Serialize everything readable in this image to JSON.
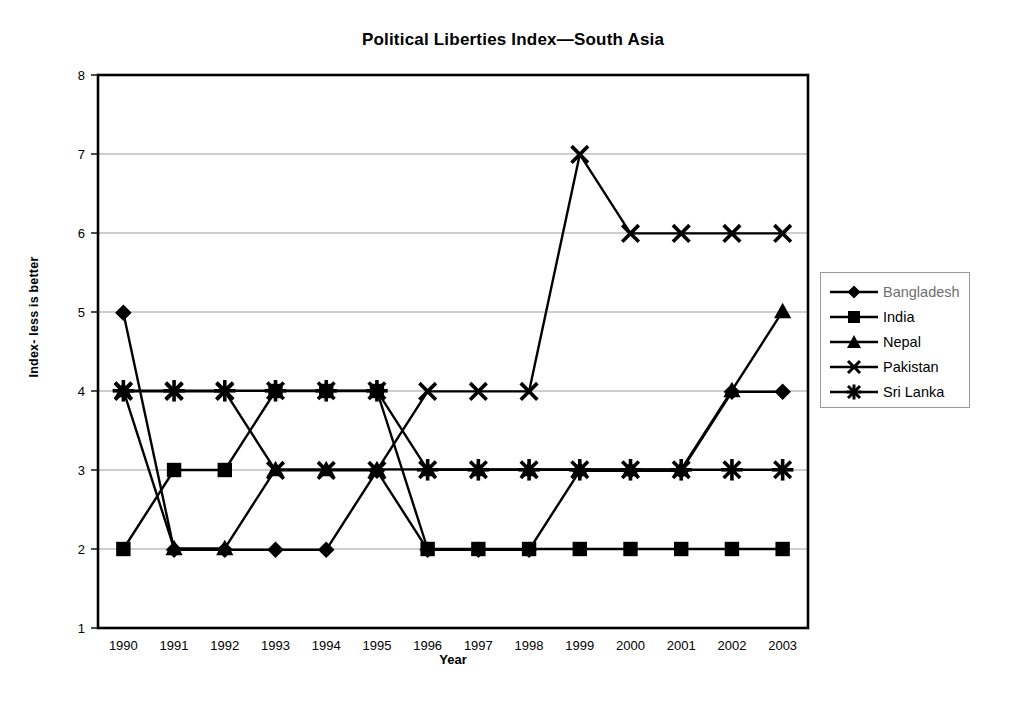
{
  "chart_data": {
    "type": "line",
    "title": "Political Liberties Index—South Asia",
    "xlabel": "Year",
    "ylabel": "Index- less is better",
    "x": [
      1990,
      1991,
      1992,
      1993,
      1994,
      1995,
      1996,
      1997,
      1998,
      1999,
      2000,
      2001,
      2002,
      2003
    ],
    "categories": [
      "1990",
      "1991",
      "1992",
      "1993",
      "1994",
      "1995",
      "1996",
      "1997",
      "1998",
      "1999",
      "2000",
      "2001",
      "2002",
      "2003"
    ],
    "xlim": [
      1990,
      2003
    ],
    "ylim": [
      1,
      8
    ],
    "yticks": [
      1,
      2,
      3,
      4,
      5,
      6,
      7,
      8
    ],
    "yticklabels": [
      "1",
      "2",
      "3",
      "4",
      "5",
      "6",
      "7",
      "8"
    ],
    "grid": "horizontal",
    "legend_position": "right",
    "series": [
      {
        "name": "Bangladesh",
        "marker": "diamond",
        "values": [
          5,
          2,
          2,
          2,
          2,
          3,
          2,
          2,
          2,
          3,
          3,
          3,
          4,
          4
        ]
      },
      {
        "name": "India",
        "marker": "square",
        "values": [
          2,
          3,
          3,
          4,
          4,
          4,
          2,
          2,
          2,
          2,
          2,
          2,
          2,
          2
        ]
      },
      {
        "name": "Nepal",
        "marker": "triangle",
        "values": [
          4,
          2,
          2,
          3,
          3,
          3,
          3,
          3,
          3,
          3,
          3,
          3,
          4,
          5
        ]
      },
      {
        "name": "Pakistan",
        "marker": "cross",
        "values": [
          4,
          4,
          4,
          3,
          3,
          3,
          4,
          4,
          4,
          7,
          6,
          6,
          6,
          6
        ]
      },
      {
        "name": "Sri Lanka",
        "marker": "star",
        "values": [
          4,
          4,
          4,
          4,
          4,
          4,
          3,
          3,
          3,
          3,
          3,
          3,
          3,
          3
        ]
      }
    ]
  },
  "legend": {
    "items": [
      {
        "label": "Bangladesh",
        "marker": "diamond"
      },
      {
        "label": "India",
        "marker": "square"
      },
      {
        "label": "Nepal",
        "marker": "triangle"
      },
      {
        "label": "Pakistan",
        "marker": "cross"
      },
      {
        "label": "Sri Lanka",
        "marker": "star"
      }
    ]
  },
  "axes": {
    "y_tick_labels": [
      "8",
      "7",
      "6",
      "5",
      "4",
      "3",
      "2",
      "1"
    ],
    "x_tick_labels": [
      "1990",
      "1991",
      "1992",
      "1993",
      "1994",
      "1995",
      "1996",
      "1997",
      "1998",
      "1999",
      "2000",
      "2001",
      "2002",
      "2003"
    ]
  },
  "colors": {
    "series": "#000000",
    "grid": "#9d9d9d",
    "axis": "#000000",
    "background": "#ffffff"
  }
}
